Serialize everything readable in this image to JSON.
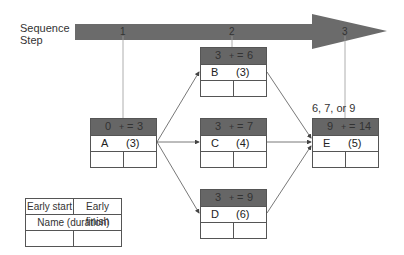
{
  "sequence": {
    "label_line1": "Sequence",
    "label_line2": "Step",
    "steps": [
      "1",
      "2",
      "3"
    ]
  },
  "nodes": [
    {
      "id": "A",
      "name": "A",
      "duration": "(3)",
      "early_start": "0",
      "early_finish": "3"
    },
    {
      "id": "B",
      "name": "B",
      "duration": "(3)",
      "early_start": "3",
      "early_finish": "6"
    },
    {
      "id": "C",
      "name": "C",
      "duration": "(4)",
      "early_start": "3",
      "early_finish": "7"
    },
    {
      "id": "D",
      "name": "D",
      "duration": "(6)",
      "early_start": "3",
      "early_finish": "9"
    },
    {
      "id": "E",
      "name": "E",
      "duration": "(5)",
      "early_start": "9",
      "early_finish": "14"
    }
  ],
  "operators": {
    "plus": "+",
    "equals": "="
  },
  "annotation": "6, 7, or 9",
  "legend": {
    "early_start": "Early start",
    "early_finish": "Early finish",
    "name_duration": "Name (duration)"
  },
  "colors": {
    "arrow": "#6b6b6b",
    "header": "#666666",
    "line": "#555555"
  }
}
